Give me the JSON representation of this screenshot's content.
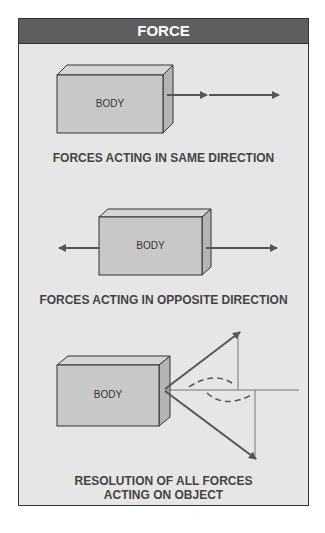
{
  "title": "FORCE",
  "panels": [
    {
      "body_label": "BODY",
      "caption": "FORCES ACTING IN SAME DIRECTION"
    },
    {
      "body_label": "BODY",
      "caption": "FORCES ACTING IN OPPOSITE DIRECTION"
    },
    {
      "body_label": "BODY",
      "caption_line1": "RESOLUTION OF ALL FORCES",
      "caption_line2": "ACTING ON OBJECT"
    }
  ],
  "colors": {
    "header": "#5e5e5e",
    "panel": "#e6e6e6",
    "box_front": "#c8c8c8",
    "arrow": "#555555"
  }
}
